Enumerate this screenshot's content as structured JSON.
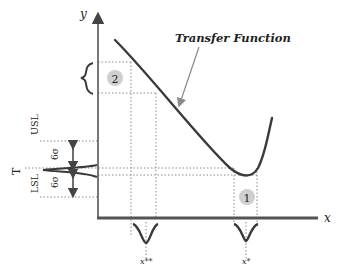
{
  "title": "Transfer Function",
  "axes": {
    "x_label": "x",
    "y_label": "y"
  },
  "markers": {
    "x_star": "x*",
    "x_double_star": "x**",
    "target": "T",
    "usl": "USL",
    "lsl": "LSL",
    "sigma_upper": "6σ",
    "sigma_lower": "6σ"
  },
  "regions": [
    {
      "id": "region-1",
      "label": "1"
    },
    {
      "id": "region-2",
      "label": "2"
    }
  ],
  "colors": {
    "curve": "#3a3a3a",
    "axis": "#555555",
    "dotted": "#888888",
    "circle_fill": "#cfcfcf",
    "arrow": "#8a8a8a"
  }
}
